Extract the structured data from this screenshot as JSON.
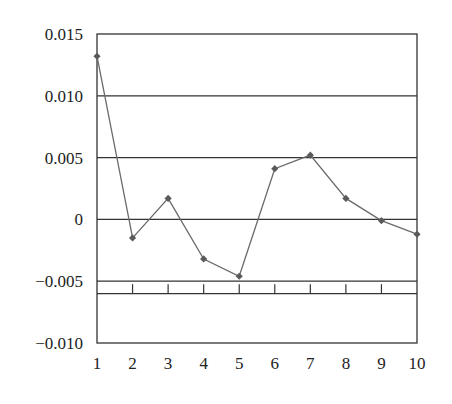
{
  "chart_data": {
    "type": "line",
    "title": "",
    "xlabel": "",
    "ylabel": "",
    "x": [
      1,
      2,
      3,
      4,
      5,
      6,
      7,
      8,
      9,
      10
    ],
    "series": [
      {
        "name": "series-1",
        "values": [
          0.0132,
          -0.0015,
          0.0017,
          -0.0032,
          -0.0046,
          0.0041,
          0.0052,
          0.0017,
          -0.0001,
          -0.0012
        ]
      }
    ],
    "ylim": [
      -0.01,
      0.015
    ],
    "xlim": [
      1,
      10
    ],
    "y_ticks": [
      0.015,
      0.01,
      0.005,
      0,
      -0.005,
      -0.01
    ],
    "y_tick_labels": [
      "0.015",
      "0.010",
      "0.005",
      "0",
      "−0.005",
      "−0.010"
    ],
    "x_tick_labels": [
      "1",
      "2",
      "3",
      "4",
      "5",
      "6",
      "7",
      "8",
      "9",
      "10"
    ],
    "gridlines_y": [
      0.01,
      0.005,
      0,
      -0.005,
      -0.006
    ],
    "grid": true,
    "legend": "none",
    "colors": {
      "line": "#6b6b6b",
      "marker": "#5a5a5a",
      "grid": "#333333",
      "frame": "#333333"
    }
  }
}
